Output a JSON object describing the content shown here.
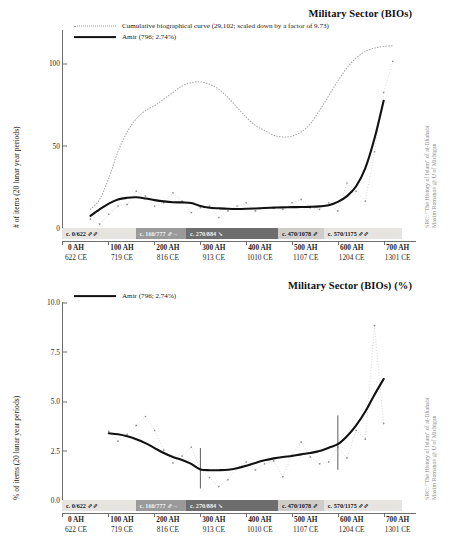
{
  "source_note": {
    "line1": "SRC: \"The History of Islam\" of al-Dhahabī",
    "line2": "Maxim Romanov @ U of Michigan"
  },
  "axis": {
    "x_ticks": [
      {
        "ah": "0 AH",
        "ce": "622 CE",
        "value": 0
      },
      {
        "ah": "100 AH",
        "ce": "719 CE",
        "value": 100
      },
      {
        "ah": "200 AH",
        "ce": "816 CE",
        "value": 200
      },
      {
        "ah": "300 AH",
        "ce": "913 CE",
        "value": 300
      },
      {
        "ah": "400 AH",
        "ce": "1010 CE",
        "value": 400
      },
      {
        "ah": "500 AH",
        "ce": "1107 CE",
        "value": 500
      },
      {
        "ah": "600 AH",
        "ce": "1204 CE",
        "value": 600
      },
      {
        "ah": "700 AH",
        "ce": "1301 CE",
        "value": 700
      }
    ]
  },
  "period_band": {
    "segments": [
      {
        "label": "c. 0/622 ⇗⇗",
        "start": 0,
        "end": 160,
        "color": "#e6e4e1",
        "dark": false
      },
      {
        "label": "c. 160/777 ⇗→",
        "start": 160,
        "end": 270,
        "color": "#9a9a9a",
        "dark": true
      },
      {
        "label": "c. 270/884 ↘",
        "start": 270,
        "end": 470,
        "color": "#6d6d6d",
        "dark": true
      },
      {
        "label": "c. 470/1078 ⇗",
        "start": 470,
        "end": 570,
        "color": "#cfcdca",
        "dark": false
      },
      {
        "label": "c. 570/1175 ⇗⇗",
        "start": 570,
        "end": 740,
        "color": "#e6e4e1",
        "dark": false
      }
    ]
  },
  "chart_data": [
    {
      "id": "military-bios-counts",
      "type": "line",
      "title": "Military Sector (BIOs)",
      "xlabel": "",
      "ylabel": "# of items (20 lunar year periods)",
      "xlim": [
        0,
        740
      ],
      "ylim": [
        0,
        120
      ],
      "y_ticks": [
        0,
        50,
        100
      ],
      "y_tick_labels": [
        "0",
        "50",
        "100"
      ],
      "grid": false,
      "legend_position": "top-left",
      "legend": [
        {
          "key": "dotted",
          "label": "Cumulative biographical curve (29,102; scaled down by a factor of 9.73)"
        },
        {
          "key": "solid",
          "label": "Amir (796; 2.74%)"
        }
      ],
      "series": [
        {
          "name": "Amir (796; 2.74%)",
          "style": "solid",
          "x": [
            60,
            80,
            100,
            120,
            140,
            160,
            180,
            200,
            220,
            240,
            260,
            280,
            300,
            320,
            340,
            360,
            380,
            400,
            420,
            440,
            460,
            480,
            500,
            520,
            540,
            560,
            580,
            600,
            620,
            640,
            660,
            680,
            700
          ],
          "values": [
            7,
            11,
            14.5,
            17,
            18,
            18.3,
            17.6,
            16.6,
            15.8,
            15.3,
            15.2,
            14.8,
            13,
            12,
            11.6,
            11.3,
            11.2,
            11.3,
            11.5,
            11.8,
            12,
            12.2,
            12.3,
            12.4,
            12.5,
            12.8,
            13.5,
            15.5,
            19,
            25,
            36,
            54,
            77
          ]
        },
        {
          "name": "Cumulative biographical curve (29,102; scaled down by a factor of 9.73)",
          "style": "dotted",
          "x": [
            60,
            80,
            100,
            120,
            140,
            160,
            180,
            200,
            220,
            240,
            260,
            280,
            300,
            320,
            340,
            360,
            380,
            400,
            420,
            440,
            460,
            480,
            500,
            520,
            540,
            560,
            580,
            600,
            620,
            640,
            660,
            680,
            700,
            720
          ],
          "values": [
            11,
            17,
            30,
            46,
            58,
            66,
            71,
            74,
            78,
            82,
            86,
            88,
            88.5,
            87,
            84,
            79,
            73,
            67,
            62,
            59,
            56,
            55,
            55.5,
            58,
            63,
            71,
            80,
            89,
            97,
            103,
            107,
            109,
            110,
            110.5
          ]
        },
        {
          "name": "raw data points",
          "style": "scatter",
          "x": [
            60,
            80,
            100,
            120,
            140,
            160,
            180,
            200,
            220,
            240,
            260,
            280,
            300,
            320,
            340,
            360,
            380,
            400,
            420,
            440,
            460,
            480,
            500,
            520,
            540,
            560,
            580,
            600,
            620,
            640,
            660,
            680,
            700,
            720
          ],
          "values": [
            5,
            2,
            8,
            13,
            14,
            22,
            19,
            13,
            15,
            21,
            16,
            9,
            12,
            13,
            6,
            10,
            13,
            15,
            10,
            12,
            12,
            11,
            15,
            17,
            12,
            11,
            15,
            10,
            27,
            22,
            16,
            46,
            82,
            101
          ]
        }
      ]
    },
    {
      "id": "military-bios-percent",
      "type": "line",
      "title": "Military Sector (BIOs) (%)",
      "xlabel": "",
      "ylabel": "% of items (20 lunar year periods)",
      "xlim": [
        0,
        740
      ],
      "ylim": [
        0.0,
        10.0
      ],
      "y_ticks": [
        0.0,
        2.5,
        5.0,
        7.5,
        10.0
      ],
      "y_tick_labels": [
        "0.0",
        "2.5",
        "5.0",
        "7.5",
        "10.0"
      ],
      "grid": false,
      "legend_position": "top-left",
      "legend": [
        {
          "key": "solid",
          "label": "Amir (796; 2.74%)"
        }
      ],
      "markers": [
        {
          "x": 300,
          "y0": 0.55,
          "y1": 2.6
        },
        {
          "x": 600,
          "y0": 1.5,
          "y1": 4.25
        }
      ],
      "series": [
        {
          "name": "Amir (796; 2.74%)",
          "style": "solid",
          "x": [
            100,
            120,
            140,
            160,
            180,
            200,
            220,
            240,
            260,
            280,
            300,
            320,
            340,
            360,
            380,
            400,
            420,
            440,
            460,
            480,
            500,
            520,
            540,
            560,
            580,
            600,
            620,
            640,
            660,
            680,
            700
          ],
          "values": [
            3.35,
            3.3,
            3.2,
            3.05,
            2.85,
            2.6,
            2.35,
            2.15,
            2.0,
            1.8,
            1.52,
            1.48,
            1.48,
            1.5,
            1.58,
            1.7,
            1.85,
            1.98,
            2.08,
            2.15,
            2.2,
            2.28,
            2.35,
            2.45,
            2.62,
            2.8,
            3.2,
            3.75,
            4.45,
            5.3,
            6.1
          ]
        },
        {
          "name": "raw data points",
          "style": "scatter",
          "x": [
            100,
            120,
            140,
            160,
            180,
            200,
            220,
            240,
            260,
            280,
            300,
            320,
            340,
            360,
            380,
            400,
            420,
            440,
            460,
            480,
            500,
            520,
            540,
            560,
            580,
            600,
            620,
            640,
            660,
            680,
            700
          ],
          "values": [
            3.45,
            2.95,
            3.3,
            3.75,
            4.2,
            3.5,
            2.5,
            1.85,
            2.2,
            2.65,
            1.52,
            1.1,
            0.65,
            1.0,
            1.6,
            1.9,
            1.5,
            1.8,
            1.95,
            1.15,
            2.25,
            2.9,
            2.15,
            1.8,
            1.9,
            2.65,
            2.1,
            3.5,
            3.05,
            8.8,
            3.85
          ]
        }
      ]
    }
  ]
}
